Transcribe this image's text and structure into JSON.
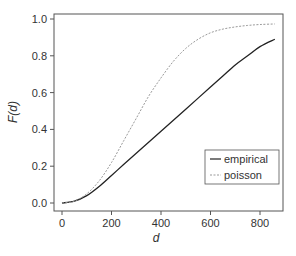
{
  "chart_data": {
    "type": "line",
    "title": "",
    "xlabel": "d",
    "ylabel": "F(d)",
    "xlim": [
      -30,
      900
    ],
    "ylim": [
      -0.05,
      1.03
    ],
    "xticks": [
      0,
      200,
      400,
      600,
      800
    ],
    "yticks": [
      0.0,
      0.2,
      0.4,
      0.6,
      0.8,
      1.0
    ],
    "xtick_labels": [
      "0",
      "200",
      "400",
      "600",
      "800"
    ],
    "ytick_labels": [
      "0.0",
      "0.2",
      "0.4",
      "0.6",
      "0.8",
      "1.0"
    ],
    "grid": false,
    "legend_position": "lower right",
    "series": [
      {
        "name": "empirical",
        "style": "solid",
        "color": "#222222",
        "x": [
          0,
          50,
          100,
          150,
          200,
          250,
          300,
          350,
          400,
          450,
          500,
          550,
          600,
          650,
          700,
          750,
          800,
          860
        ],
        "values": [
          0.0,
          0.01,
          0.04,
          0.09,
          0.15,
          0.21,
          0.27,
          0.33,
          0.39,
          0.45,
          0.51,
          0.57,
          0.63,
          0.69,
          0.75,
          0.8,
          0.85,
          0.89
        ]
      },
      {
        "name": "poisson",
        "style": "dashed",
        "color": "#999999",
        "x": [
          0,
          50,
          100,
          150,
          200,
          250,
          300,
          350,
          400,
          450,
          500,
          550,
          600,
          650,
          700,
          750,
          800,
          860
        ],
        "values": [
          0.0,
          0.01,
          0.05,
          0.12,
          0.22,
          0.34,
          0.46,
          0.58,
          0.68,
          0.77,
          0.84,
          0.89,
          0.925,
          0.945,
          0.957,
          0.965,
          0.97,
          0.973
        ]
      }
    ]
  },
  "legend": {
    "items": [
      {
        "label": "empirical"
      },
      {
        "label": "poisson"
      }
    ]
  },
  "axes": {
    "xlabel": "d",
    "ylabel": "F(d)"
  }
}
